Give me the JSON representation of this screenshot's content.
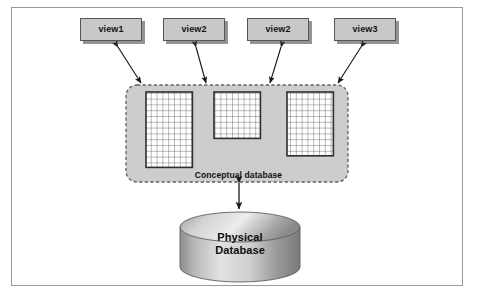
{
  "figure": {
    "background": "#ffffff",
    "frame_color": "#9a9a9a"
  },
  "views": [
    {
      "label": "view1",
      "x": 80,
      "y": 18
    },
    {
      "label": "view2",
      "x": 163,
      "y": 18
    },
    {
      "label": "view2",
      "x": 247,
      "y": 18
    },
    {
      "label": "view3",
      "x": 334,
      "y": 18
    }
  ],
  "conceptual": {
    "label": "Conceptual database",
    "fill": "#cdcdcd",
    "border_color": "#6b6b6b",
    "border_style": "dashed",
    "x": 126,
    "y": 85,
    "width": 222,
    "height": 97,
    "tables": [
      {
        "name": "table-grid-1",
        "x": 146,
        "y": 92,
        "width": 46,
        "height": 76,
        "cols": 8,
        "rows": 13
      },
      {
        "name": "table-grid-2",
        "x": 214,
        "y": 92,
        "width": 46,
        "height": 49,
        "cols": 9,
        "rows": 9
      },
      {
        "name": "table-grid-3",
        "x": 287,
        "y": 92,
        "width": 48,
        "height": 62,
        "cols": 10,
        "rows": 11
      }
    ]
  },
  "physical": {
    "label_line1": "Physical",
    "label_line2": "Database",
    "x": 180,
    "y": 212,
    "width": 120,
    "height": 70,
    "fill_light": "#e4e4e4",
    "fill_dark": "#7d7d7d"
  },
  "connectors": [
    {
      "name": "view1-link",
      "from": "conceptual",
      "to": "view1",
      "double_headed": true
    },
    {
      "name": "view2a-link",
      "from": "conceptual",
      "to": "view2",
      "double_headed": true
    },
    {
      "name": "view2b-link",
      "from": "conceptual",
      "to": "view2",
      "double_headed": true
    },
    {
      "name": "view3-link",
      "from": "conceptual",
      "to": "view3",
      "double_headed": true
    },
    {
      "name": "conceptual-physical-link",
      "from": "conceptual",
      "to": "physical",
      "double_headed": true
    }
  ],
  "colors": {
    "box_fill": "#c8c8c8",
    "box_stroke": "#555555",
    "panel_fill": "#cdcdcd",
    "grid_stroke": "#4a4a4a",
    "arrow_stroke": "#1a1a1a",
    "text": "#111111"
  }
}
